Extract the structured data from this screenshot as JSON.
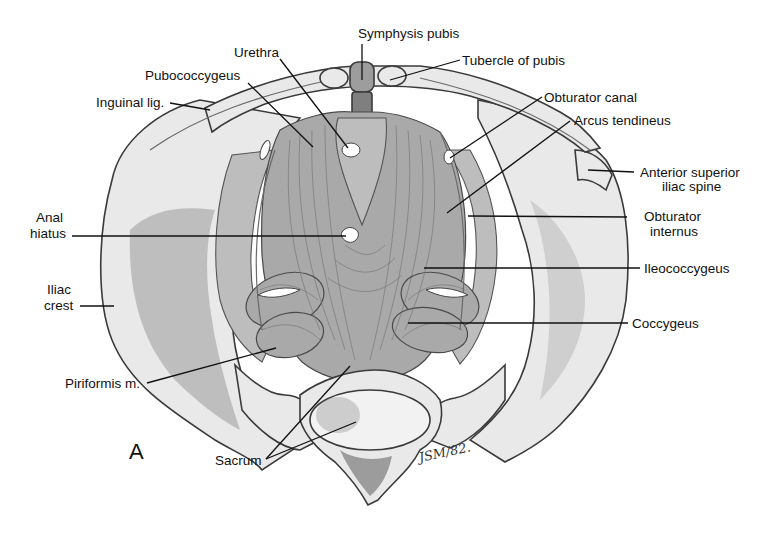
{
  "figure": {
    "panel_letter": "A",
    "signature": "JSM/82.",
    "labels": [
      {
        "id": "symphysis-pubis",
        "text": "Symphysis pubis",
        "lines": [
          "Symphysis pubis"
        ]
      },
      {
        "id": "tubercle-of-pubis",
        "text": "Tubercle of pubis",
        "lines": [
          "Tubercle of pubis"
        ]
      },
      {
        "id": "urethra",
        "text": "Urethra",
        "lines": [
          "Urethra"
        ]
      },
      {
        "id": "pubococcygeus",
        "text": "Pubococcygeus",
        "lines": [
          "Pubococcygeus"
        ]
      },
      {
        "id": "inguinal-lig",
        "text": "Inguinal lig.",
        "lines": [
          "Inguinal lig."
        ]
      },
      {
        "id": "obturator-canal",
        "text": "Obturator canal",
        "lines": [
          "Obturator canal"
        ]
      },
      {
        "id": "arcus-tendineus",
        "text": "Arcus tendineus",
        "lines": [
          "Arcus tendineus"
        ]
      },
      {
        "id": "anterior-superior-iliac-spine",
        "text": "Anterior superior iliac spine",
        "lines": [
          "Anterior superior",
          "iliac spine"
        ]
      },
      {
        "id": "anal-hiatus",
        "text": "Anal hiatus",
        "lines": [
          "Anal",
          "hiatus"
        ]
      },
      {
        "id": "obturator-internus",
        "text": "Obturator internus",
        "lines": [
          "Obturator",
          "internus"
        ]
      },
      {
        "id": "ileococcygeus",
        "text": "Ileococcygeus",
        "lines": [
          "Ileococcygeus"
        ]
      },
      {
        "id": "iliac-crest",
        "text": "Iliac crest",
        "lines": [
          "Iliac",
          "crest"
        ]
      },
      {
        "id": "coccygeus",
        "text": "Coccygeus",
        "lines": [
          "Coccygeus"
        ]
      },
      {
        "id": "piriformis-m",
        "text": "Piriformis m.",
        "lines": [
          "Piriformis m."
        ]
      },
      {
        "id": "sacrum",
        "text": "Sacrum",
        "lines": [
          "Sacrum"
        ]
      }
    ]
  }
}
